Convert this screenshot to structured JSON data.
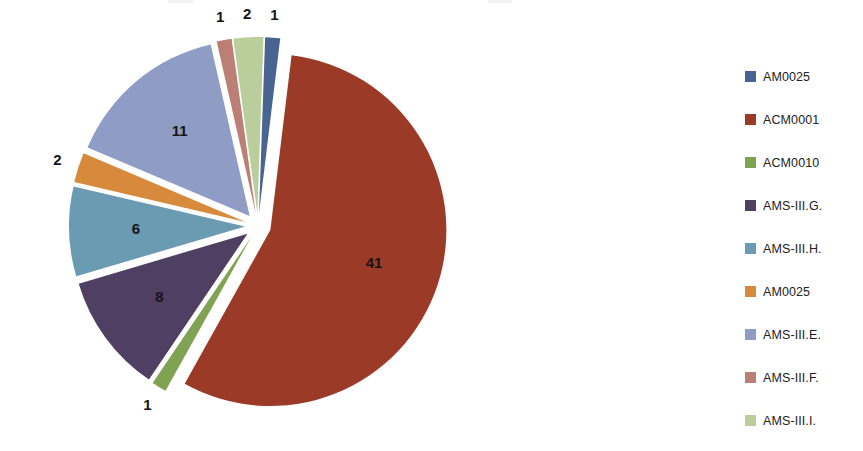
{
  "chart_data": {
    "type": "pie",
    "title": "",
    "subtitle": "",
    "xlabel": "",
    "ylabel": "",
    "total": 73,
    "exploded": true,
    "legend_position": "right",
    "grid": false,
    "categories": [
      "AM0025",
      "ACM0001",
      "ACM0010",
      "AMS-III.G.",
      "AMS-III.H.",
      "AM0025",
      "AMS-III.E.",
      "AMS-III.F.",
      "AMS-III.I."
    ],
    "values": [
      1,
      41,
      1,
      8,
      6,
      2,
      11,
      1,
      2
    ],
    "colors": [
      "#4A6491",
      "#9C3A28",
      "#7FA352",
      "#4E3F63",
      "#6B9BB3",
      "#D78A3C",
      "#8E9CC6",
      "#BC7F76",
      "#B9CE9A"
    ],
    "data_labels": [
      "1",
      "41",
      "1",
      "8",
      "6",
      "2",
      "11",
      "1",
      "2"
    ]
  },
  "legend": {
    "items": [
      {
        "label": "AM0025",
        "color": "#4A6491",
        "value": 1
      },
      {
        "label": "ACM0001",
        "color": "#9C3A28",
        "value": 41
      },
      {
        "label": "ACM0010",
        "color": "#7FA352",
        "value": 1
      },
      {
        "label": "AMS-III.G.",
        "color": "#4E3F63",
        "value": 8
      },
      {
        "label": "AMS-III.H.",
        "color": "#6B9BB3",
        "value": 6
      },
      {
        "label": "AM0025",
        "color": "#D78A3C",
        "value": 2
      },
      {
        "label": "AMS-III.E.",
        "color": "#8E9CC6",
        "value": 11
      },
      {
        "label": "AMS-III.F.",
        "color": "#BC7F76",
        "value": 1
      },
      {
        "label": "AMS-III.I.",
        "color": "#B9CE9A",
        "value": 2
      }
    ]
  }
}
